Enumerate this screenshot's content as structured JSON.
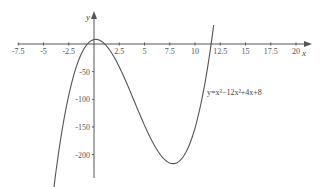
{
  "chart_data": {
    "type": "line",
    "title": "",
    "xlabel": "x",
    "ylabel": "y",
    "equation_label": "y=x³−12x²+4x+8",
    "function": "x^3-12x^2+4x+8",
    "xlim": [
      -7.5,
      21
    ],
    "ylim": [
      -250,
      55
    ],
    "x_ticks": [
      -7.5,
      -5,
      -2.5,
      2.5,
      5,
      7.5,
      10,
      12.5,
      15,
      17.5,
      20
    ],
    "x_tick_labels": [
      "-7.5",
      "-5",
      "-2.5",
      "2.5",
      "5",
      "7.5",
      "10",
      "12.5",
      "15",
      "17.5",
      "20"
    ],
    "y_ticks": [
      -50,
      -100,
      -150,
      -200
    ],
    "y_tick_labels": [
      "-50",
      "-100",
      "-150",
      "-200"
    ],
    "grid": false,
    "legend": null,
    "curve_domain": [
      -4.0,
      11.85
    ],
    "key_points": {
      "local_max": {
        "x": 0.17,
        "y": 8.3
      },
      "local_min": {
        "x": 7.83,
        "y": -216.3
      },
      "y_intercept": {
        "x": 0,
        "y": 8
      },
      "x_roots": [
        -0.6,
        0.95,
        11.65
      ]
    },
    "colors": {
      "axis": "#555555",
      "curve": "#555555",
      "text": "#555555"
    }
  }
}
